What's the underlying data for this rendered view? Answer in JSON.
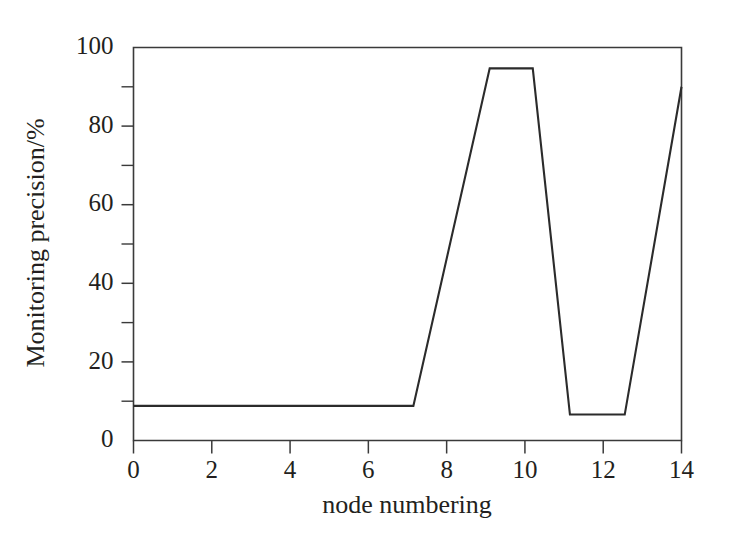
{
  "chart_data": {
    "type": "line",
    "title": "",
    "xlabel": "node numbering",
    "ylabel": "Monitoring precision/%",
    "xlim": [
      0,
      14
    ],
    "ylim": [
      0,
      100
    ],
    "grid": false,
    "legend": "none",
    "x_major_ticks": [
      0,
      2,
      4,
      6,
      8,
      10,
      12,
      14
    ],
    "x_tick_labels": [
      "0",
      "2",
      "4",
      "6",
      "8",
      "10",
      "12",
      "14"
    ],
    "y_major_ticks": [
      0,
      20,
      40,
      60,
      80,
      100
    ],
    "y_tick_labels": [
      "0",
      "20",
      "40",
      "60",
      "80",
      "100"
    ],
    "y_minor_ticks": [
      10,
      30,
      50,
      70,
      90
    ],
    "line_color": "#2b2b2b",
    "series": [
      {
        "name": "monitoring precision",
        "x": [
          0.0,
          6.9,
          7.15,
          9.1,
          10.2,
          11.15,
          11.3,
          12.55,
          14.0
        ],
        "y": [
          8.8,
          8.8,
          8.8,
          94.7,
          94.7,
          6.6,
          6.6,
          6.6,
          90.0
        ]
      }
    ],
    "points": [
      {
        "x": 0.0,
        "y": 8.8
      },
      {
        "x": 7.15,
        "y": 8.8
      },
      {
        "x": 9.1,
        "y": 94.7
      },
      {
        "x": 10.2,
        "y": 94.7
      },
      {
        "x": 11.15,
        "y": 6.6
      },
      {
        "x": 12.55,
        "y": 6.6
      },
      {
        "x": 14.0,
        "y": 90.0
      }
    ],
    "annotations": []
  },
  "axes": {
    "y_title": "Monitoring precision/%",
    "x_title": "node numbering"
  }
}
